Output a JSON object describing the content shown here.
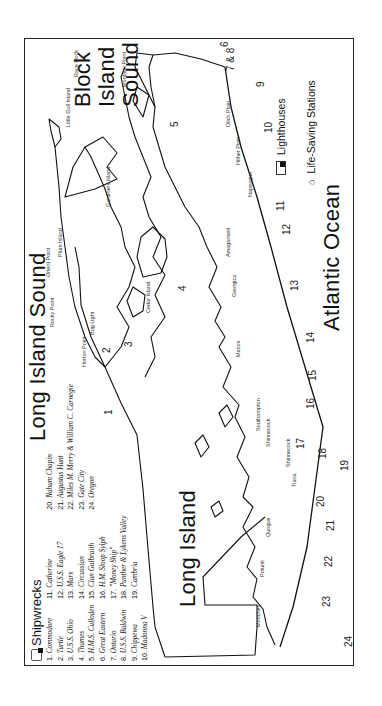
{
  "map": {
    "titles": {
      "block_island_sound": [
        "Block",
        "Island",
        "Sound"
      ],
      "long_island_sound": "Long Island Sound",
      "atlantic_ocean": "Atlantic Ocean",
      "long_island": "Long Island"
    },
    "legend": {
      "title": "Shipwrecks",
      "col1": [
        {
          "n": "1.",
          "name": "Commodore"
        },
        {
          "n": "2.",
          "name": "Turtle"
        },
        {
          "n": "3.",
          "name": "U.S.S. Ohio"
        },
        {
          "n": "4.",
          "name": "Thames"
        },
        {
          "n": "5.",
          "name": "H.M.S. Culloden"
        },
        {
          "n": "6.",
          "name": "Great Eastern"
        },
        {
          "n": "7.",
          "name": "Ontario"
        },
        {
          "n": "8.",
          "name": "U.S.S. Baldwin"
        },
        {
          "n": "9.",
          "name": "Chippewa"
        },
        {
          "n": "10.",
          "name": "Madonna V"
        }
      ],
      "col2": [
        {
          "n": "11.",
          "name": "Catherine"
        },
        {
          "n": "12.",
          "name": "U.S.S. Eagle 17"
        },
        {
          "n": "13.",
          "name": "Marx"
        },
        {
          "n": "14.",
          "name": "Circassian"
        },
        {
          "n": "15.",
          "name": "Clan Galbraith"
        },
        {
          "n": "16.",
          "name": "H.M. Sloop Sylph"
        },
        {
          "n": "17.",
          "name": "\"Money Ship\""
        },
        {
          "n": "18.",
          "name": "Panther & Lykens Valley"
        },
        {
          "n": "19.",
          "name": "Cambria"
        }
      ],
      "col3": [
        {
          "n": "20.",
          "name": "Nahum Chapin"
        },
        {
          "n": "21.",
          "name": "Augustus Hunt"
        },
        {
          "n": "22.",
          "name": "Miles M. Merry & William C. Carnegie"
        },
        {
          "n": "23.",
          "name": "Gate City"
        },
        {
          "n": "24.",
          "name": "Oregon"
        }
      ],
      "keys": {
        "lighthouses": "Lighthouses",
        "life_saving_stations": "Life-Saving Stations"
      }
    },
    "places": {
      "montauk_point": "Montauk Point",
      "ditch_plain": "Ditch Plain",
      "hither_plain": "Hither Plain",
      "napeague": "Napeague",
      "race_rock": "Race Rock",
      "little_gull_island": "Little Gull Island",
      "gardiners_island": "Gardiners Island",
      "plum_island": "Plum Island",
      "orient_point": "Orient Point",
      "rocky_point": "Rocky Point",
      "bug_light": "Bug Light",
      "cedar_island": "Cedar Island",
      "amagansett": "Amagansett",
      "georgica": "Georgica",
      "mecox": "Mecox",
      "southampton": "Southampton",
      "horton_point": "Horton Point",
      "shinnecock": "Shinnecock",
      "tiana": "Tiana",
      "quogue": "Quogue",
      "potunk": "Potunk",
      "moriches": "Moriches"
    },
    "wreck_numbers": [
      "1",
      "2",
      "3",
      "4",
      "5",
      "6",
      "7 & 8",
      "9",
      "10",
      "11",
      "12",
      "13",
      "14",
      "15",
      "16",
      "17",
      "18",
      "19",
      "20",
      "21",
      "22",
      "23",
      "24"
    ]
  }
}
